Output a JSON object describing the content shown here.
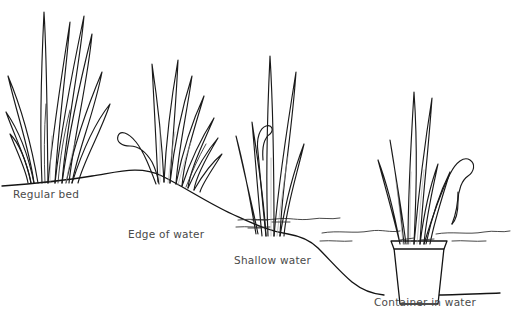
{
  "figure": {
    "background_color": "#ffffff",
    "ink_color": "#1a1a1a",
    "caption_color": "#4a4a4a"
  },
  "captions": {
    "regular_bed": "Regular bed",
    "edge_of_water": "Edge of water",
    "shallow_water": "Shallow water",
    "container_in_water": "Container in water"
  },
  "plants": [
    {
      "id": "plant-regular-bed",
      "label": "Regular bed",
      "setting": "dry ground",
      "leaf_count": 11
    },
    {
      "id": "plant-edge-of-water",
      "label": "Edge of water",
      "setting": "bank edge",
      "leaf_count": 9
    },
    {
      "id": "plant-shallow-water",
      "label": "Shallow water",
      "setting": "shallow water",
      "leaf_count": 7
    },
    {
      "id": "plant-container",
      "label": "Container in water",
      "setting": "container submerged in water",
      "leaf_count": 9
    }
  ]
}
